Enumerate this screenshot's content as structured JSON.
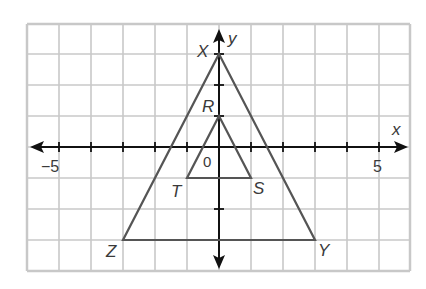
{
  "diagram": {
    "type": "coordinate-plane",
    "axes": {
      "x_label": "x",
      "y_label": "y",
      "origin_label": "0",
      "x_range": [
        -6,
        6
      ],
      "y_range": [
        -4,
        4
      ],
      "tick_labels": [
        {
          "value": -5,
          "text": "−5"
        },
        {
          "value": 5,
          "text": "5"
        }
      ]
    },
    "triangles": [
      {
        "name": "XYZ",
        "vertices": [
          {
            "label": "X",
            "x": 0,
            "y": 3
          },
          {
            "label": "Y",
            "x": 3,
            "y": -3
          },
          {
            "label": "Z",
            "x": -3,
            "y": -3
          }
        ]
      },
      {
        "name": "RST",
        "vertices": [
          {
            "label": "R",
            "x": 0,
            "y": 1
          },
          {
            "label": "S",
            "x": 1,
            "y": -1
          },
          {
            "label": "T",
            "x": -1,
            "y": -1
          }
        ]
      }
    ],
    "colors": {
      "grid": "#c8c8c8",
      "axis": "#111111",
      "triangle": "#555555",
      "label": "#3a3a3a"
    }
  }
}
